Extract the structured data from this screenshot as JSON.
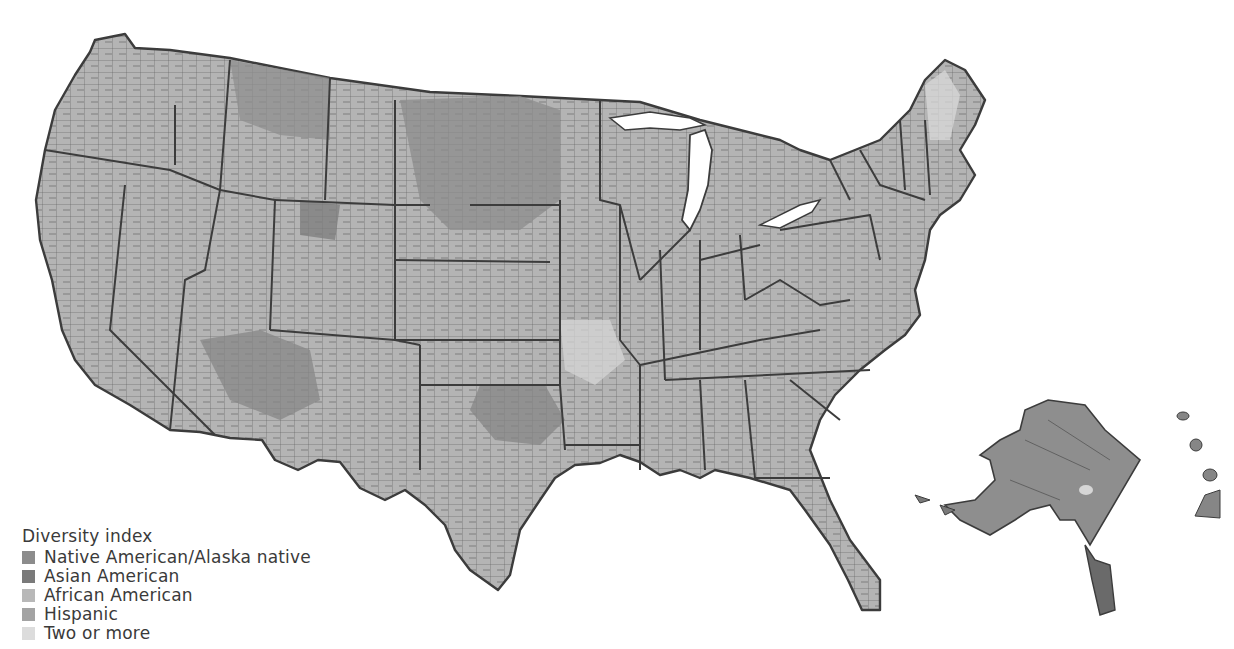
{
  "map": {
    "subject": "United States counties",
    "style": "grayscale choropleth",
    "background_color": "#ffffff",
    "border_color": "#3c3c3c",
    "regions_shown": [
      "Contiguous United States",
      "Alaska",
      "Hawaii"
    ]
  },
  "legend": {
    "title": "Diversity index",
    "items": [
      {
        "label": "Native American/Alaska native",
        "color": "#8c8c8c"
      },
      {
        "label": "Asian American",
        "color": "#7a7a7a"
      },
      {
        "label": "African American",
        "color": "#b8b8b8"
      },
      {
        "label": "Hispanic",
        "color": "#a3a3a3"
      },
      {
        "label": "Two or more",
        "color": "#dcdcdc"
      }
    ]
  }
}
